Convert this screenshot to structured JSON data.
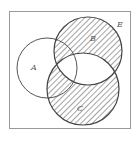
{
  "diagram": {
    "type": "venn",
    "universe_label": "E",
    "sets": [
      {
        "label": "A",
        "cx": 47,
        "cy": 68,
        "r": 30
      },
      {
        "label": "B",
        "cx": 88,
        "cy": 51,
        "r": 34
      },
      {
        "label": "C",
        "cx": 83,
        "cy": 89,
        "r": 36
      }
    ],
    "shaded_region": "B △ C (symmetric difference of B and C)",
    "frame": {
      "x": 9,
      "y": 11,
      "width": 122,
      "height": 118
    },
    "colors": {
      "stroke": "#444444",
      "frame": "#999999",
      "hatch": "#555555",
      "background": "#ffffff"
    }
  },
  "labels": {
    "a": "A",
    "b": "B",
    "c": "C",
    "e": "E"
  }
}
